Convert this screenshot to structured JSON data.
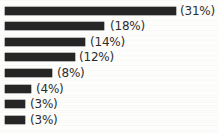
{
  "chart_data": {
    "type": "bar",
    "orientation": "horizontal",
    "title": "",
    "subtitle": "",
    "xlabel": "",
    "ylabel": "",
    "grid": false,
    "legend": null,
    "axis_visible": false,
    "tick_labels": [],
    "xlim": [
      0,
      31
    ],
    "categories": [
      "",
      "",
      "",
      "",
      "",
      "",
      "",
      ""
    ],
    "values": [
      31,
      18,
      14,
      12,
      8,
      4,
      3,
      3
    ],
    "data_labels": [
      "(31%)",
      "(18%)",
      "(14%)",
      "(12%)",
      "(8%)",
      "(4%)",
      "(3%)",
      "(3%)"
    ],
    "bar_color": "#262626",
    "label_color": "#2d2d2d",
    "background_color": "#fdfdfc",
    "bars": [
      {
        "value": 31,
        "label": "(31%)",
        "bar_width_px": 171,
        "label_x_px": 180,
        "row_y_px": 3
      },
      {
        "value": 18,
        "label": "(18%)",
        "bar_width_px": 99,
        "label_x_px": 110,
        "row_y_px": 18
      },
      {
        "value": 14,
        "label": "(14%)",
        "bar_width_px": 80,
        "label_x_px": 90,
        "row_y_px": 34
      },
      {
        "value": 12,
        "label": "(12%)",
        "bar_width_px": 70,
        "label_x_px": 79,
        "row_y_px": 49
      },
      {
        "value": 8,
        "label": "(8%)",
        "bar_width_px": 47,
        "label_x_px": 57,
        "row_y_px": 65
      },
      {
        "value": 4,
        "label": "(4%)",
        "bar_width_px": 26,
        "label_x_px": 36,
        "row_y_px": 81
      },
      {
        "value": 3,
        "label": "(3%)",
        "bar_width_px": 20,
        "label_x_px": 30,
        "row_y_px": 96
      },
      {
        "value": 3,
        "label": "(3%)",
        "bar_width_px": 20,
        "label_x_px": 30,
        "row_y_px": 112
      }
    ]
  }
}
